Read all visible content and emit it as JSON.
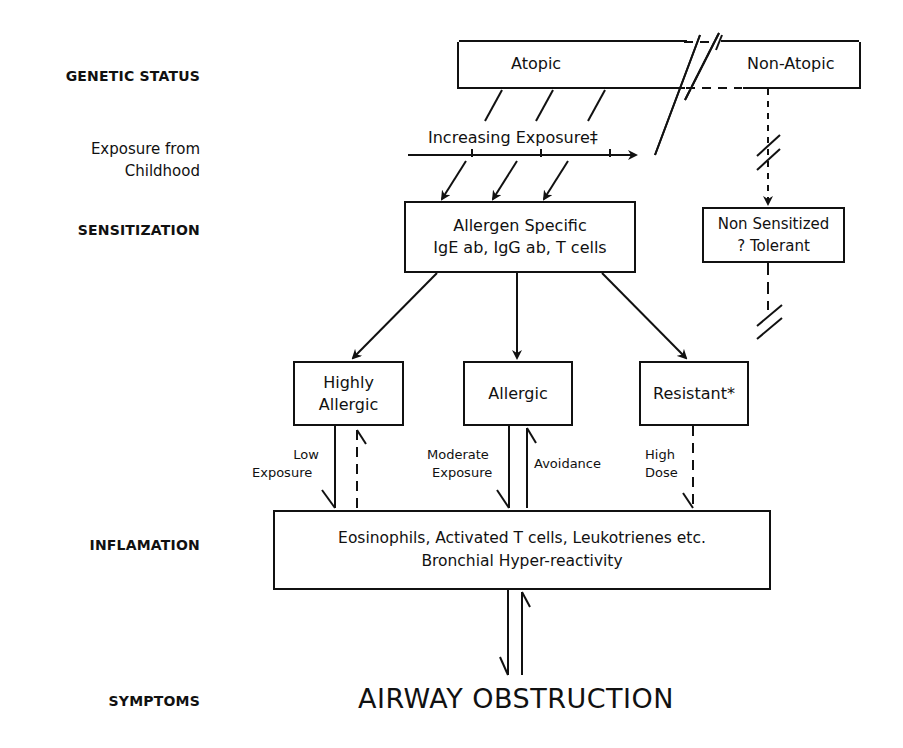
{
  "stages": {
    "genetic_status": "GENETIC STATUS",
    "exposure_line1": "Exposure from",
    "exposure_line2": "Childhood",
    "sensitization": "SENSITIZATION",
    "inflamation": "INFLAMATION",
    "symptoms": "SYMPTOMS"
  },
  "genetic_box": {
    "atopic": "Atopic",
    "non_atopic": "Non-Atopic"
  },
  "exposure_arrow": {
    "label": "Increasing Exposure‡"
  },
  "allergen_box": {
    "line1": "Allergen Specific",
    "line2": "IgE ab, IgG ab, T cells"
  },
  "non_sensitized_box": {
    "line1": "Non Sensitized",
    "line2": "? Tolerant"
  },
  "outcome_boxes": [
    {
      "line1": "Highly",
      "line2": "Allergic"
    },
    {
      "line1": "Allergic"
    },
    {
      "line1": "Resistant*"
    }
  ],
  "edge_labels": {
    "low_exposure_1": "Low",
    "low_exposure_2": "Exposure",
    "moderate_exposure_1": "Moderate",
    "moderate_exposure_2": "Exposure",
    "avoidance": "Avoidance",
    "high_dose_1": "High",
    "high_dose_2": "Dose"
  },
  "inflammation_box": {
    "line1": "Eosinophils, Activated T cells, Leukotrienes etc.",
    "line2": "Bronchial Hyper-reactivity"
  },
  "symptom": "AIRWAY OBSTRUCTION",
  "colors": {
    "ink": "#111111",
    "background": "#ffffff"
  }
}
